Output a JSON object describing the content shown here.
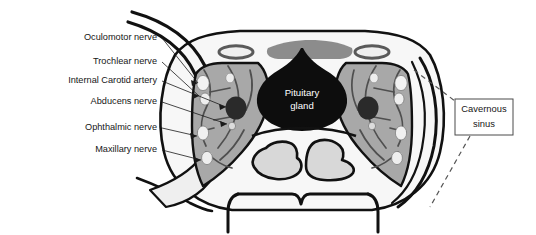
{
  "figure": {
    "background_color": "#ffffff",
    "width": 536,
    "height": 235
  },
  "labels": {
    "items": [
      {
        "id": "oculomotor-nerve",
        "text": "Oculomotor nerve",
        "text_x": 157,
        "text_y": 38,
        "tip_x": 198,
        "tip_y": 83
      },
      {
        "id": "trochlear-nerve",
        "text": "Trochlear nerve",
        "text_x": 157,
        "text_y": 62,
        "tip_x": 200,
        "tip_y": 96
      },
      {
        "id": "internal-carotid-artery",
        "text": "Internal Carotid artery",
        "text_x": 157,
        "text_y": 81,
        "tip_x": 228,
        "tip_y": 107
      },
      {
        "id": "abducens-nerve",
        "text": "Abducens nerve",
        "text_x": 157,
        "text_y": 102,
        "tip_x": 222,
        "tip_y": 124
      },
      {
        "id": "ophthalmic-nerve",
        "text": "Ophthalmic nerve",
        "text_x": 157,
        "text_y": 128,
        "tip_x": 199,
        "tip_y": 137
      },
      {
        "id": "maxillary-nerve",
        "text": "Maxillary nerve",
        "text_x": 157,
        "text_y": 150,
        "tip_x": 203,
        "tip_y": 160
      }
    ]
  },
  "gland": {
    "line1": "Pituitary",
    "line2": "gland",
    "center_x": 302,
    "line1_y": 93,
    "line2_y": 106,
    "fill_color": "#0d0d0d",
    "text_color": "#ffffff"
  },
  "callout": {
    "line1": "Cavernous",
    "line2": "sinus",
    "box_x": 455,
    "box_y": 99,
    "box_w": 58,
    "box_h": 36,
    "border_color": "#4a4a4a",
    "leader_upper": "M 414 70 L 455 101",
    "leader_lower": "M 470 135 L 430 205"
  },
  "palette": {
    "outline": "#111111",
    "cavernous_sinus": "#a8a8a8",
    "nerve_dot": "#f0f0f0",
    "carotid": "#2a2a2a",
    "bone_light": "#f3f3f3",
    "sinus_air": "#d8d8d8",
    "optic_band": "#8c8c8c",
    "vessel_line": "#4f4f4f",
    "label_text": "#161616"
  }
}
